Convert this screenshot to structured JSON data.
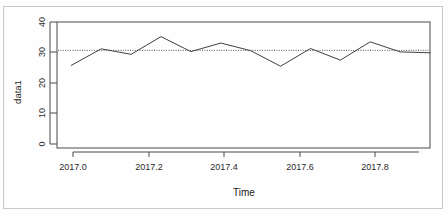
{
  "chart_data": {
    "type": "line",
    "title": "",
    "subtitle": "",
    "xlabel": "Time",
    "ylabel": "data1",
    "xlim": [
      2016.96,
      2018.0
    ],
    "ylim": [
      0,
      40
    ],
    "xticks": [
      2017.0,
      2017.2,
      2017.4,
      2017.6,
      2017.8
    ],
    "xtick_labels": [
      "2017.0",
      "2017.2",
      "2017.4",
      "2017.6",
      "2017.8"
    ],
    "yticks": [
      0,
      10,
      20,
      30,
      40
    ],
    "ytick_labels": [
      "0",
      "10",
      "20",
      "30",
      "40"
    ],
    "grid": false,
    "legend": null,
    "series": [
      {
        "name": "data1",
        "style": "solid",
        "color": "#404040",
        "x": [
          2017.0,
          2017.0833,
          2017.1667,
          2017.25,
          2017.3333,
          2017.4167,
          2017.5,
          2017.5833,
          2017.6667,
          2017.75,
          2017.8333,
          2017.9167,
          2018.0
        ],
        "values": [
          25.8,
          31.2,
          29.4,
          35.2,
          30.3,
          33.1,
          30.6,
          25.5,
          31.3,
          27.5,
          33.5,
          30.2,
          29.9
        ]
      },
      {
        "name": "mean-reference",
        "style": "dotted",
        "color": "#555555",
        "constant_y": 30.7
      }
    ],
    "annotations": []
  },
  "axes": {
    "y_axis_label": "data1",
    "x_axis_label": "Time"
  }
}
